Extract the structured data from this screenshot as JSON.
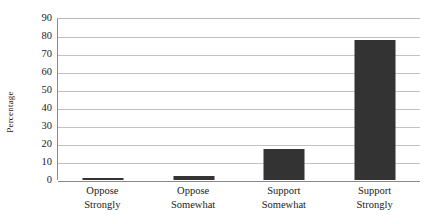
{
  "chart_data": {
    "type": "bar",
    "title": "",
    "subtitle": "",
    "xlabel": "",
    "ylabel": "Percentage",
    "categories": [
      "Oppose Strongly",
      "Oppose Somewhat",
      "Support Somewhat",
      "Support Strongly"
    ],
    "category_lines": [
      [
        "Oppose",
        "Strongly"
      ],
      [
        "Oppose",
        "Somewhat"
      ],
      [
        "Support",
        "Somewhat"
      ],
      [
        "Support",
        "Strongly"
      ]
    ],
    "values": [
      1,
      2,
      17,
      78
    ],
    "ylim": [
      0,
      90
    ],
    "ytick_step": 10,
    "yticks": [
      0,
      10,
      20,
      30,
      40,
      50,
      60,
      70,
      80,
      90
    ],
    "ytick_labels": [
      "0",
      "10",
      "20",
      "30",
      "40",
      "50",
      "60",
      "70",
      "80",
      "90"
    ],
    "grid": true,
    "grid_axis": "y",
    "legend": false,
    "legend_position": "none",
    "bar_color": "#333333",
    "gridline_color": "#c2c2c2",
    "axis_color": "#8a8a8a",
    "background_color": "#ffffff",
    "text_color": "#1a1a1a"
  }
}
